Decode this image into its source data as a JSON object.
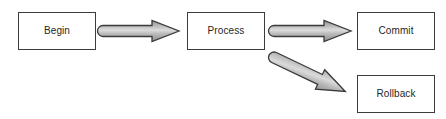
{
  "diagram": {
    "canvas": {
      "width": 446,
      "height": 119,
      "background": "#ffffff"
    },
    "style": {
      "box_fill": "#ffffff",
      "box_border": "#3c3c3c",
      "text_color": "#262626",
      "arrow_fill": "#a9a9a9",
      "arrow_fill_light": "#d4d4d4",
      "arrow_outline": "#3a3a3a"
    },
    "nodes": [
      {
        "id": "begin",
        "label": "Begin",
        "x": 18,
        "y": 12,
        "w": 78,
        "h": 38
      },
      {
        "id": "process",
        "label": "Process",
        "x": 187,
        "y": 12,
        "w": 78,
        "h": 38
      },
      {
        "id": "commit",
        "label": "Commit",
        "x": 357,
        "y": 12,
        "w": 78,
        "h": 38
      },
      {
        "id": "rollback",
        "label": "Rollback",
        "x": 357,
        "y": 75,
        "w": 78,
        "h": 38
      }
    ],
    "edges": [
      {
        "id": "begin-to-process",
        "from": "begin",
        "to": "process",
        "label": "",
        "direction": "right"
      },
      {
        "id": "process-to-commit",
        "from": "process",
        "to": "commit",
        "label": "",
        "direction": "right"
      },
      {
        "id": "process-to-rollback",
        "from": "process",
        "to": "rollback",
        "label": "",
        "direction": "down-right"
      }
    ]
  }
}
